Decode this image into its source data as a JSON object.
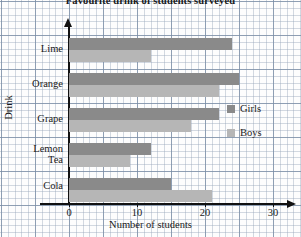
{
  "chart_data": {
    "type": "bar",
    "orientation": "horizontal",
    "title": "Favourite drink of students surveyed",
    "xlabel": "Number of students",
    "ylabel": "Drink",
    "categories": [
      "Lime",
      "Orange",
      "Grape",
      "Lemon Tea",
      "Cola"
    ],
    "series": [
      {
        "name": "Girls",
        "color": "#8a8a8a",
        "values": [
          24,
          25,
          22,
          12,
          15
        ]
      },
      {
        "name": "Boys",
        "color": "#b6b6b6",
        "values": [
          12,
          22,
          18,
          9,
          21
        ]
      }
    ],
    "xlim": [
      0,
      33
    ],
    "xticks": [
      0,
      10,
      20,
      30
    ],
    "xtick_labels": [
      "0",
      "10",
      "20",
      "30"
    ],
    "grid": true,
    "legend_position": "right"
  },
  "axis": {
    "x_label": "Number of students",
    "y_label": "Drink",
    "ticks": [
      {
        "label": "0",
        "value": 0
      },
      {
        "label": "10",
        "value": 10
      },
      {
        "label": "20",
        "value": 20
      },
      {
        "label": "30",
        "value": 30
      }
    ]
  },
  "legend": {
    "items": [
      {
        "label": "Girls",
        "color": "#8a8a8a"
      },
      {
        "label": "Boys",
        "color": "#b6b6b6"
      }
    ]
  },
  "categories": [
    {
      "label": "Lime",
      "line1": "Lime",
      "line2": ""
    },
    {
      "label": "Orange",
      "line1": "Orange",
      "line2": ""
    },
    {
      "label": "Grape",
      "line1": "Grape",
      "line2": ""
    },
    {
      "label": "Lemon Tea",
      "line1": "Lemon",
      "line2": "Tea"
    },
    {
      "label": "Cola",
      "line1": "Cola",
      "line2": ""
    }
  ]
}
